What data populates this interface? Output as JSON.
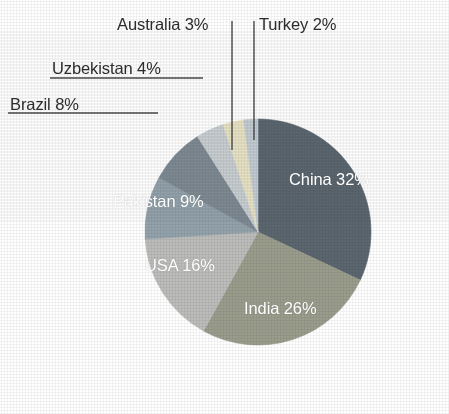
{
  "chart_data": {
    "type": "pie",
    "title": "",
    "subtitle": "",
    "xlabel": "",
    "ylabel": "",
    "legend_position": "none",
    "grid": false,
    "unit": "%",
    "start_angle_deg": 0,
    "direction": "clockwise",
    "categories": [
      "China",
      "India",
      "USA",
      "Pakistan",
      "Brazil",
      "Uzbekistan",
      "Australia",
      "Turkey"
    ],
    "values": [
      32,
      26,
      16,
      9,
      8,
      4,
      3,
      2
    ],
    "slices": [
      {
        "name": "China",
        "value": 32,
        "label": "China 32%",
        "color": "#5b666f",
        "label_placement": "inside",
        "label_color": "#ffffff"
      },
      {
        "name": "India",
        "value": 26,
        "label": "India 26%",
        "color": "#9a9c8c",
        "label_placement": "inside",
        "label_color": "#ffffff"
      },
      {
        "name": "USA",
        "value": 16,
        "label": "USA 16%",
        "color": "#bcbdbb",
        "label_placement": "inside",
        "label_color": "#ffffff"
      },
      {
        "name": "Pakistan",
        "value": 9,
        "label": "Pakistan 9%",
        "color": "#93a2ab",
        "label_placement": "inside",
        "label_color": "#ffffff"
      },
      {
        "name": "Brazil",
        "value": 8,
        "label": "Brazil 8%",
        "color": "#7e8a93",
        "label_placement": "outside",
        "label_color": "#2c2c2c",
        "leader": "horizontal-underline"
      },
      {
        "name": "Uzbekistan",
        "value": 4,
        "label": "Uzbekistan 4%",
        "color": "#c8ced1",
        "label_placement": "outside",
        "label_color": "#2c2c2c",
        "leader": "horizontal-underline"
      },
      {
        "name": "Australia",
        "value": 3,
        "label": "Australia 3%",
        "color": "#e8e2c5",
        "label_placement": "outside",
        "label_color": "#2c2c2c",
        "leader": "vertical"
      },
      {
        "name": "Turkey",
        "value": 2,
        "label": "Turkey 2%",
        "color": "#c3ccd3",
        "label_placement": "outside",
        "label_color": "#2c2c2c",
        "leader": "vertical"
      }
    ]
  },
  "labels": {
    "china": "China 32%",
    "india": "India 26%",
    "usa": "USA 16%",
    "pakistan": "Pakistan 9%",
    "brazil": "Brazil 8%",
    "uzbekistan": "Uzbekistan 4%",
    "australia": "Australia 3%",
    "turkey": "Turkey 2%"
  },
  "colors": {
    "background": "#ffffff",
    "leader_line": "#4a4a4a",
    "outside_label_text": "#2c2c2c",
    "inside_label_text": "#ffffff"
  },
  "geometry": {
    "center_x": 258,
    "center_y": 232,
    "radius": 113
  }
}
